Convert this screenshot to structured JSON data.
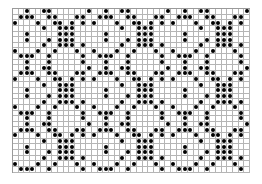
{
  "chart": {
    "rows": 29,
    "cols": 42,
    "cell_px": 5.65,
    "dot_color": "#000000",
    "grid_color": "#b5b5b5",
    "tile": {
      "width": 14,
      "height": 10,
      "rows": [
        [
          2,
          5,
          6,
          13
        ],
        [
          1,
          2,
          3,
          6,
          7,
          11,
          12
        ],
        [
          0,
          4,
          7,
          8,
          10,
          12
        ],
        [
          5,
          8,
          9,
          10
        ],
        [
          2,
          8,
          9,
          10
        ],
        [
          2,
          6,
          8,
          9,
          10
        ],
        [
          5,
          8,
          9,
          10,
          12
        ],
        [
          0,
          4,
          7,
          11
        ],
        [
          1,
          2,
          3,
          6,
          12
        ],
        [
          2,
          6,
          12
        ]
      ]
    }
  }
}
